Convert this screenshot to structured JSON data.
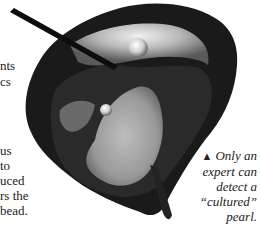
{
  "body_text": {
    "lines": [
      {
        "text": "nts",
        "top": 58
      },
      {
        "text": "cs",
        "top": 74
      },
      {
        "text": "us",
        "top": 143
      },
      {
        "text": " to",
        "top": 158
      },
      {
        "text": "uced",
        "top": 173
      },
      {
        "text": "rs the",
        "top": 188
      },
      {
        "text": "bead.",
        "top": 203
      }
    ]
  },
  "photo": {
    "subject": "opened oyster with pearls and probe",
    "icon": "oyster-photo"
  },
  "caption": {
    "marker": "▲",
    "lines": [
      "Only an",
      "expert can",
      "detect a",
      "“cultured”",
      "pearl."
    ]
  }
}
